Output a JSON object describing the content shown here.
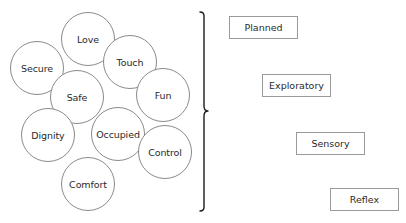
{
  "circles": [
    {
      "label": "Love"
    },
    {
      "label": "Secure"
    },
    {
      "label": "Touch"
    },
    {
      "label": "Safe"
    },
    {
      "label": "Fun"
    },
    {
      "label": "Dignity"
    },
    {
      "label": "Occupied"
    },
    {
      "label": "Control"
    },
    {
      "label": "Comfort"
    }
  ],
  "bracket": {
    "type": "right-curly-brace"
  },
  "levels": [
    {
      "label": "Planned"
    },
    {
      "label": "Exploratory"
    },
    {
      "label": "Sensory"
    },
    {
      "label": "Reflex"
    }
  ],
  "colors": {
    "circle_stroke": "#8a8a8a",
    "box_stroke": "#9a9a9a",
    "bracket_stroke": "#1a1a1a",
    "text": "#2a2a2a"
  }
}
